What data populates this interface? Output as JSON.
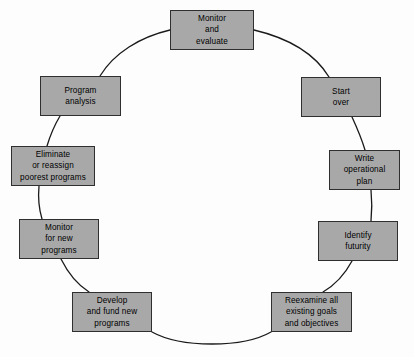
{
  "diagram": {
    "type": "cycle-diagram",
    "background_color": "#fdfdfd",
    "node_fill_color": "#a8a8a8",
    "node_border_color": "#2f2f2f",
    "arc_color": "#1a1a1a",
    "node_count": 10,
    "nodes": [
      {
        "id": "monitor-and-evaluate",
        "label": "Monitor\nand\nevaluate",
        "x": 170,
        "y": 10,
        "w": 84,
        "h": 40
      },
      {
        "id": "start-over",
        "label": "Start\nover",
        "x": 301,
        "y": 77,
        "w": 80,
        "h": 40
      },
      {
        "id": "write-operational-plan",
        "label": "Write\noperational\nplan",
        "x": 329,
        "y": 150,
        "w": 71,
        "h": 40
      },
      {
        "id": "identify-futurity",
        "label": "Identify\nfuturity",
        "x": 318,
        "y": 221,
        "w": 80,
        "h": 40
      },
      {
        "id": "reexamine-goals",
        "label": "Reexamine all\nexisting goals\nand objectives",
        "x": 271,
        "y": 292,
        "w": 81,
        "h": 40
      },
      {
        "id": "develop-and-fund",
        "label": "Develop\nand fund new\nprograms",
        "x": 72,
        "y": 292,
        "w": 80,
        "h": 40
      },
      {
        "id": "monitor-for-new",
        "label": "Monitor\nfor new\nprograms",
        "x": 19,
        "y": 219,
        "w": 80,
        "h": 40
      },
      {
        "id": "eliminate-or-reassign",
        "label": "Eliminate\nor reassign\npoorest programs",
        "x": 11,
        "y": 146,
        "w": 84,
        "h": 40
      },
      {
        "id": "program-analysis",
        "label": "Program\nanalysis",
        "x": 40,
        "y": 76,
        "w": 81,
        "h": 40
      }
    ],
    "arcs": [
      {
        "from": "monitor-and-evaluate",
        "to": "start-over",
        "path": "M 254 30 C 288 38 315 54 329 77"
      },
      {
        "from": "start-over",
        "to": "write-operational-plan",
        "path": "M 352 117 C 358 130 362 140 365 150"
      },
      {
        "from": "write-operational-plan",
        "to": "identify-futurity",
        "path": "M 371 190 C 372 200 372 211 371 221"
      },
      {
        "from": "identify-futurity",
        "to": "reexamine-goals",
        "path": "M 352 261 C 345 274 335 285 323 292"
      },
      {
        "from": "reexamine-goals",
        "to": "develop-and-fund",
        "path": "M 271 332 C 243 348 181 348 152 332"
      },
      {
        "from": "develop-and-fund",
        "to": "monitor-for-new",
        "path": "M 89 292 C 78 285 68 273 61 259"
      },
      {
        "from": "monitor-for-new",
        "to": "eliminate-or-reassign",
        "path": "M 42 219 C 39 209 38 197 39 186"
      },
      {
        "from": "eliminate-or-reassign",
        "to": "program-analysis",
        "path": "M 47 146 C 50 136 54 126 60 116"
      },
      {
        "from": "program-analysis",
        "to": "monitor-and-evaluate",
        "path": "M 100 76 C 114 53 140 37 170 30"
      }
    ]
  }
}
